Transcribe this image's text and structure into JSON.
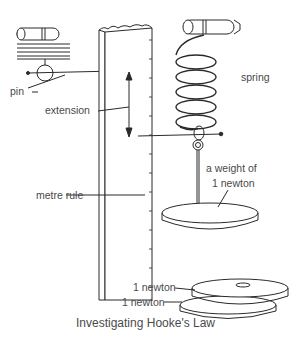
{
  "diagram": {
    "title": "Investigating Hooke's Law",
    "labels": {
      "pin": "pin",
      "extension": "extension",
      "metre_rule": "metre rule",
      "spring": "spring",
      "weight_line1": "a weight of",
      "weight_line2": "1 newton",
      "stack_top": "1  newton",
      "stack_bottom": "1 newton"
    },
    "components": [
      "metre-rule",
      "spring",
      "clamp-rod",
      "pin-pointer",
      "weight-hanger",
      "slotted-weight-1-newton",
      "slotted-weight-1-newton",
      "inset-pin-detail"
    ],
    "colors": {
      "line": "#2a2a2a",
      "text": "#4a4a4a",
      "background": "#ffffff"
    }
  }
}
